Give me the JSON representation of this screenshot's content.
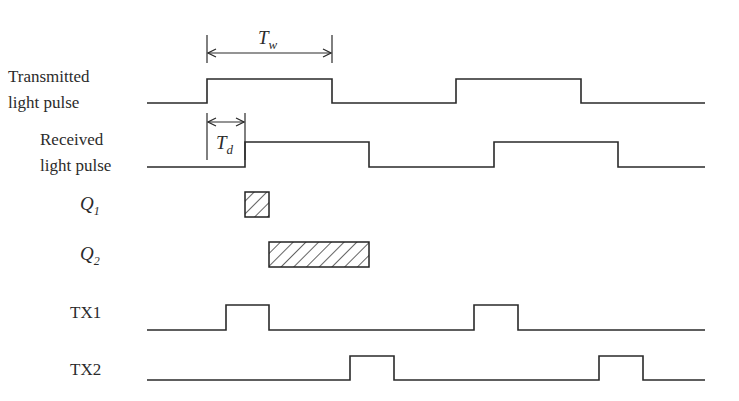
{
  "diagram": {
    "colors": {
      "line": "#2a2a2a",
      "background": "#ffffff"
    },
    "signals": [
      {
        "id": "transmitted",
        "label_lines": [
          "Transmitted",
          "light pulse"
        ],
        "label_pos": [
          [
            8,
            82
          ],
          [
            8,
            108
          ]
        ],
        "low_y": 103,
        "high_y": 79,
        "x_start": 147,
        "x_end": 705,
        "edges": [
          [
            207,
            332
          ],
          [
            456,
            581
          ]
        ]
      },
      {
        "id": "received",
        "label_lines": [
          "Received",
          "light pulse"
        ],
        "label_pos": [
          [
            40,
            145
          ],
          [
            40,
            171
          ]
        ],
        "low_y": 167,
        "high_y": 142,
        "x_start": 147,
        "x_end": 705,
        "edges": [
          [
            245,
            369
          ],
          [
            494,
            618
          ]
        ]
      },
      {
        "id": "tx1",
        "label_lines": [
          "TX1"
        ],
        "label_pos": [
          [
            70,
            318
          ]
        ],
        "low_y": 330,
        "high_y": 305,
        "x_start": 147,
        "x_end": 705,
        "edges": [
          [
            226,
            269
          ],
          [
            474,
            518
          ]
        ]
      },
      {
        "id": "tx2",
        "label_lines": [
          "TX2"
        ],
        "label_pos": [
          [
            70,
            375
          ]
        ],
        "low_y": 380,
        "high_y": 356,
        "x_start": 147,
        "x_end": 705,
        "edges": [
          [
            350,
            394
          ],
          [
            599,
            643
          ]
        ]
      }
    ],
    "charges": [
      {
        "id": "q1",
        "symbol": "Q",
        "subscript": "1",
        "label_x": 80,
        "label_y": 210,
        "x": 245,
        "y": 192,
        "w": 24,
        "h": 25
      },
      {
        "id": "q2",
        "symbol": "Q",
        "subscript": "2",
        "label_x": 80,
        "label_y": 260,
        "x": 269,
        "y": 242,
        "w": 100,
        "h": 25
      }
    ],
    "dimensions": [
      {
        "id": "tw",
        "symbol": "T",
        "subscript": "w",
        "x1": 207,
        "x2": 332,
        "tick_top": 35,
        "tick_bottom": 63,
        "arrow_y": 53,
        "label_x": 258,
        "label_y": 44
      },
      {
        "id": "td",
        "symbol": "T",
        "subscript": "d",
        "x1": 207,
        "x2": 245,
        "tick_top": 113,
        "tick_bottom": 160,
        "arrow_y": 122,
        "label_x": 216,
        "label_y": 149
      }
    ]
  }
}
